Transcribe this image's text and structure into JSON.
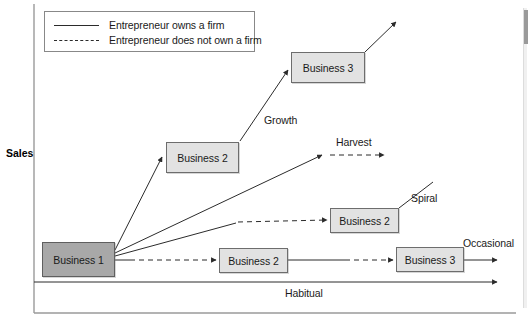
{
  "axis": {
    "y_label": "Sales",
    "y_axis_x": 34,
    "x_axis_y": 313,
    "baseline_label": "Habitual"
  },
  "legend": {
    "items": [
      {
        "style": "solid",
        "label": "Entrepreneur owns a firm"
      },
      {
        "style": "dashed",
        "label": "Entrepreneur does not own a firm"
      }
    ]
  },
  "nodes": [
    {
      "id": "business-1",
      "label": "Business 1",
      "variant": "primary",
      "x": 42,
      "y": 242,
      "w": 73,
      "h": 35
    },
    {
      "id": "business-2-growth",
      "label": "Business 2",
      "variant": "light",
      "x": 166,
      "y": 142,
      "w": 73,
      "h": 31
    },
    {
      "id": "business-3-growth",
      "label": "Business 3",
      "variant": "light",
      "x": 291,
      "y": 52,
      "w": 74,
      "h": 31
    },
    {
      "id": "business-2-spiral",
      "label": "Business 2",
      "variant": "light",
      "x": 330,
      "y": 208,
      "w": 69,
      "h": 25
    },
    {
      "id": "business-2-habitual",
      "label": "Business 2",
      "variant": "light",
      "x": 219,
      "y": 248,
      "w": 69,
      "h": 25
    },
    {
      "id": "business-3-habitual",
      "label": "Business 3",
      "variant": "light",
      "x": 396,
      "y": 247,
      "w": 68,
      "h": 25
    }
  ],
  "flow_labels": [
    {
      "id": "growth",
      "text": "Growth",
      "x": 264,
      "y": 114
    },
    {
      "id": "harvest",
      "text": "Harvest",
      "x": 336,
      "y": 136
    },
    {
      "id": "spiral",
      "text": "Spiral",
      "x": 411,
      "y": 192
    },
    {
      "id": "occasional",
      "text": "Occasional",
      "x": 463,
      "y": 237
    },
    {
      "id": "habitual",
      "text": "Habitual",
      "x": 285,
      "y": 287
    }
  ],
  "colors": {
    "line": "#2b2b2b",
    "axis": "#9a9a9a",
    "node_primary_fill": "#a8a8a8",
    "node_light_fill": "#e2e2e2",
    "node_border": "#6d6d6d",
    "background": "#ffffff"
  }
}
